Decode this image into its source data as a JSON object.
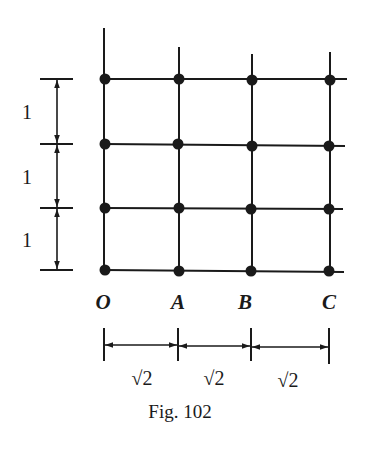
{
  "figure": {
    "caption": "Fig. 102",
    "points": [
      {
        "label": "O",
        "x": 104
      },
      {
        "label": "A",
        "x": 178
      },
      {
        "label": "B",
        "x": 252
      },
      {
        "label": "C",
        "x": 330
      }
    ],
    "rows_y": [
      79,
      144,
      208,
      270
    ],
    "vertical_dimension": {
      "labels": [
        "1",
        "1",
        "1"
      ],
      "spacing_value": 1
    },
    "horizontal_dimension": {
      "labels": [
        "√2",
        "√2",
        "√2"
      ],
      "spacing_value": "√2"
    },
    "colors": {
      "ink": "#1a1a1a",
      "background": "#ffffff"
    }
  }
}
